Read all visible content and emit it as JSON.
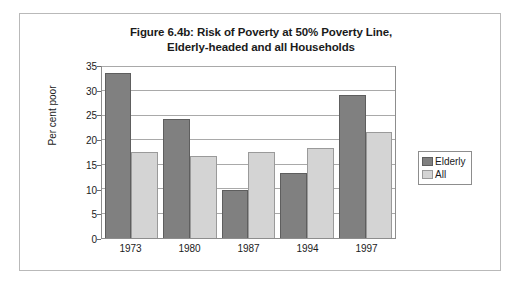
{
  "figure": {
    "title_line1": "Figure 6.4b: Risk of Poverty at 50% Poverty Line,",
    "title_line2": "Elderly-headed and all Households"
  },
  "chart_data": {
    "type": "bar",
    "title": "Figure 6.4b: Risk of Poverty at 50% Poverty Line, Elderly-headed and all Households",
    "xlabel": "",
    "ylabel": "Per cent poor",
    "categories": [
      "1973",
      "1980",
      "1987",
      "1994",
      "1997"
    ],
    "series": [
      {
        "name": "Elderly",
        "color": "#808080",
        "values": [
          33.8,
          24.3,
          9.9,
          13.4,
          29.3
        ]
      },
      {
        "name": "All",
        "color": "#d4d4d4",
        "values": [
          17.7,
          16.8,
          17.6,
          18.4,
          21.8
        ]
      }
    ],
    "ylim": [
      0,
      35
    ],
    "yticks": [
      0,
      5,
      10,
      15,
      20,
      25,
      30,
      35
    ],
    "ytick_labels": [
      "0",
      "5",
      "10",
      "15",
      "20",
      "25",
      "30",
      "35"
    ],
    "grid": true,
    "grid_axis": "y",
    "legend_position": "right"
  }
}
